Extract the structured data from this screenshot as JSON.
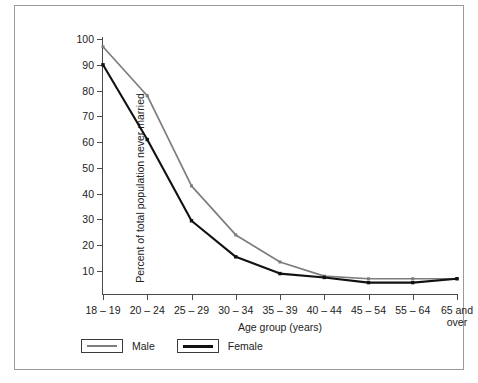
{
  "chart_data": {
    "type": "line",
    "title": "",
    "xlabel": "Age group (years)",
    "ylabel": "Percent of total population never married",
    "categories": [
      "18 – 19",
      "20 – 24",
      "25 – 29",
      "30 – 34",
      "35 – 39",
      "40 – 44",
      "45 – 54",
      "55 – 64",
      "65 and over"
    ],
    "yticks": [
      10,
      20,
      30,
      40,
      50,
      60,
      70,
      80,
      90,
      100
    ],
    "ylim": [
      0,
      103
    ],
    "grid": false,
    "legend_position": "bottom-left",
    "series": [
      {
        "name": "Male",
        "color": "#7d7d7d",
        "values": [
          97,
          78,
          43,
          24,
          13.5,
          8,
          7,
          7,
          7
        ]
      },
      {
        "name": "Female",
        "color": "#111111",
        "values": [
          90,
          61,
          29.5,
          15.5,
          9,
          7.5,
          5.5,
          5.5,
          7
        ]
      }
    ]
  },
  "legend": {
    "items": [
      {
        "label": "Male"
      },
      {
        "label": "Female"
      }
    ]
  },
  "colors": {
    "male": "#7d7d7d",
    "female": "#111111",
    "axis": "#4a4a4a",
    "frame": "#9a9a9a",
    "background": "#ffffff"
  }
}
